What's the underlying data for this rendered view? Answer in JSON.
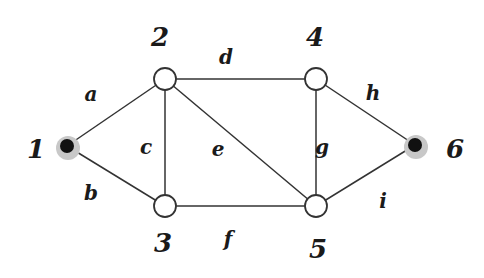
{
  "diagram": {
    "type": "undirected-graph",
    "nodes": [
      {
        "id": "1",
        "label": "1",
        "x": 67,
        "y": 146,
        "style": "filled",
        "lx": 36,
        "ly": 158
      },
      {
        "id": "2",
        "label": "2",
        "x": 165,
        "y": 79,
        "style": "open",
        "lx": 160,
        "ly": 46
      },
      {
        "id": "3",
        "label": "3",
        "x": 165,
        "y": 206,
        "style": "open",
        "lx": 163,
        "ly": 252
      },
      {
        "id": "4",
        "label": "4",
        "x": 316,
        "y": 79,
        "style": "open",
        "lx": 315,
        "ly": 46
      },
      {
        "id": "5",
        "label": "5",
        "x": 316,
        "y": 206,
        "style": "open",
        "lx": 318,
        "ly": 258
      },
      {
        "id": "6",
        "label": "6",
        "x": 415,
        "y": 145,
        "style": "filled",
        "lx": 455,
        "ly": 158
      }
    ],
    "edges": [
      {
        "label": "a",
        "from": "1",
        "to": "2",
        "lx": 91,
        "ly": 101
      },
      {
        "label": "b",
        "from": "1",
        "to": "3",
        "lx": 91,
        "ly": 200
      },
      {
        "label": "c",
        "from": "2",
        "to": "3",
        "lx": 146,
        "ly": 154
      },
      {
        "label": "d",
        "from": "2",
        "to": "4",
        "lx": 226,
        "ly": 64
      },
      {
        "label": "e",
        "from": "2",
        "to": "5",
        "lx": 218,
        "ly": 156
      },
      {
        "label": "f",
        "from": "3",
        "to": "5",
        "lx": 228,
        "ly": 246
      },
      {
        "label": "g",
        "from": "4",
        "to": "5",
        "lx": 322,
        "ly": 154
      },
      {
        "label": "h",
        "from": "4",
        "to": "6",
        "lx": 373,
        "ly": 100
      },
      {
        "label": "i",
        "from": "5",
        "to": "6",
        "lx": 383,
        "ly": 208
      }
    ],
    "colors": {
      "line": "#333333",
      "node_fill": "#ffffff",
      "node_stroke": "#333333",
      "terminal_fill": "#111111",
      "terminal_halo": "#c8c8c8"
    }
  }
}
